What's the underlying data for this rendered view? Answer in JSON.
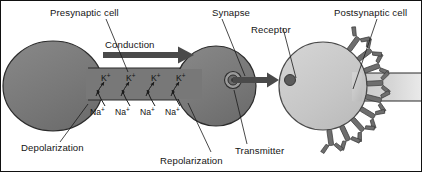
{
  "figure": {
    "title_alt": "Neuron synapse diagram showing presynaptic cell, action potential conduction, synapse and postsynaptic cell",
    "background_color": "#ffffff",
    "width": 422,
    "height": 172
  },
  "colors": {
    "presynaptic_fill": "#7a7a7a",
    "presynaptic_stroke": "#2b2b2b",
    "postsynaptic_fill": "#c9c9c9",
    "postsynaptic_stroke": "#4a4a4a",
    "receptor_fill": "#6e6e6e",
    "arrow_fill": "#4a4a4a",
    "text_color": "#151515",
    "axon_band_light": "#d8d8d8"
  },
  "labels": {
    "presynaptic_cell": "Presynaptic cell",
    "conduction": "Conduction",
    "synapse": "Synapse",
    "receptor": "Receptor",
    "postsynaptic_cell": "Postsynaptic cell",
    "depolarization": "Depolarization",
    "repolarization": "Repolarization",
    "transmitter": "Transmitter"
  },
  "ions": {
    "potassium": {
      "symbol": "K",
      "charge": "+",
      "count": 4,
      "direction": "efflux-out-of-cell",
      "positions_x": [
        102,
        126,
        150,
        174
      ]
    },
    "sodium": {
      "symbol": "Na",
      "charge": "+",
      "count": 4,
      "direction": "influx-into-cell",
      "positions_x": [
        96,
        121,
        146,
        171
      ]
    }
  },
  "elements": {
    "conduction_arrow": "rightward-thick-arrow",
    "vesicle": "synaptic-vesicle-spiral",
    "transmitter_particle": "neurotransmitter-dot",
    "release_arrow": "transmitter-release-arrow",
    "receptors": {
      "shape": "y-shaped-receptor",
      "count": 9
    }
  }
}
